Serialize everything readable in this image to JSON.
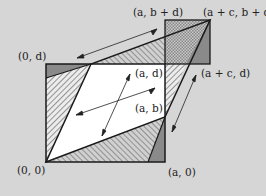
{
  "diagram": {
    "labels": {
      "origin": "(0, 0)",
      "a0": "(a, 0)",
      "zero_d": "(0, d)",
      "a_d": "(a, d)",
      "a_b": "(a, b)",
      "a_bd": "(a, b + d)",
      "ac_bd": "(a + c, b + d)",
      "ac_d": "(a + c, d)"
    },
    "vertices_px": {
      "origin": [
        46,
        162
      ],
      "a0": [
        165,
        162
      ],
      "zero_d": [
        46,
        64
      ],
      "a_d": [
        165,
        64
      ],
      "a_b": [
        165,
        117
      ],
      "ac_bd": [
        210,
        20
      ],
      "c_d": [
        91,
        64
      ],
      "ac_d": [
        210,
        64
      ]
    },
    "colors": {
      "background": "#d6d6d6",
      "line": "#1a1a1a",
      "dark_fill": "#8a8a8a",
      "white_fill": "#ffffff"
    }
  }
}
